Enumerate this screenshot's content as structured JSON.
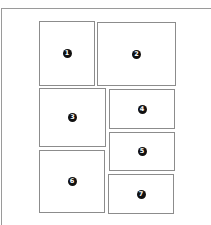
{
  "diagram": {
    "type": "page-layout-wireframe",
    "border_color": "#8c8c8c",
    "badge_color": "#111111",
    "panels": [
      {
        "label": "1",
        "x": 39,
        "y": 21,
        "w": 56,
        "h": 65
      },
      {
        "label": "2",
        "x": 97,
        "y": 22,
        "w": 79,
        "h": 64
      },
      {
        "label": "3",
        "x": 39,
        "y": 88,
        "w": 67,
        "h": 59
      },
      {
        "label": "4",
        "x": 109,
        "y": 89,
        "w": 66,
        "h": 40
      },
      {
        "label": "5",
        "x": 109,
        "y": 132,
        "w": 66,
        "h": 39
      },
      {
        "label": "6",
        "x": 39,
        "y": 150,
        "w": 66,
        "h": 63
      },
      {
        "label": "7",
        "x": 108,
        "y": 174,
        "w": 66,
        "h": 40
      }
    ]
  }
}
